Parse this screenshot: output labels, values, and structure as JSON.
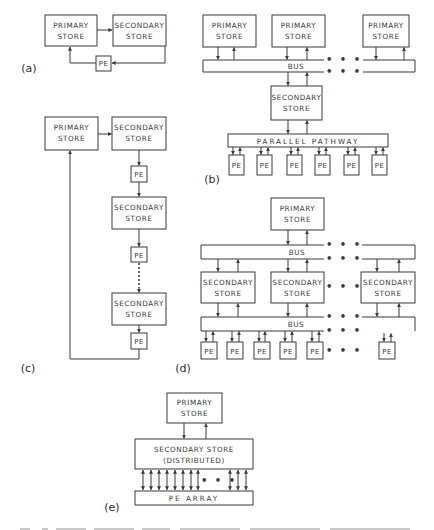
{
  "figure": {
    "panels": {
      "a": {
        "label": "(a)",
        "primary": [
          "PRIMARY",
          "STORE"
        ],
        "secondary": [
          "SECONDARY",
          "STORE"
        ],
        "pe": "PE"
      },
      "b": {
        "label": "(b)",
        "primary": [
          "PRIMARY",
          "STORE"
        ],
        "bus": "BUS",
        "secondary": [
          "SECONDARY",
          "STORE"
        ],
        "pathway": "PARALLEL PATHWAY",
        "pe": "PE",
        "ellipsis": "• • •"
      },
      "c": {
        "label": "(c)",
        "primary": [
          "PRIMARY",
          "STORE"
        ],
        "secondary": [
          "SECONDARY",
          "STORE"
        ],
        "pe": "PE"
      },
      "d": {
        "label": "(d)",
        "primary": [
          "PRIMARY",
          "STORE"
        ],
        "bus": "BUS",
        "secondary": [
          "SECONDARY",
          "STORE"
        ],
        "pe": "PE",
        "ellipsis": "• • •"
      },
      "e": {
        "label": "(e)",
        "primary": [
          "PRIMARY",
          "STORE"
        ],
        "secondary": [
          "SECONDARY STORE",
          "(DISTRIBUTED)"
        ],
        "pe_array": "PE ARRAY",
        "ellipsis": "• • •"
      }
    },
    "caption_visible": false
  }
}
